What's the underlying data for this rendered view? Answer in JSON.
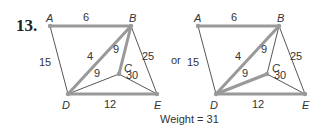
{
  "problem_number": "13.",
  "connector": "or",
  "weight_text": "Weight = 31",
  "colors": {
    "thin_edge": "#444444",
    "thick_edge": "#999999",
    "node": "#999999",
    "text": "#333333"
  },
  "graphs": [
    {
      "id": "left",
      "nodes": {
        "A": {
          "x": 50,
          "y": 26
        },
        "B": {
          "x": 131,
          "y": 26
        },
        "C": {
          "x": 119,
          "y": 74
        },
        "D": {
          "x": 68,
          "y": 94
        },
        "E": {
          "x": 157,
          "y": 94
        }
      },
      "edges": [
        {
          "from": "A",
          "to": "B",
          "weight": "6",
          "highlighted": true,
          "lx": 86,
          "ly": 21
        },
        {
          "from": "A",
          "to": "D",
          "weight": "15",
          "highlighted": false,
          "lx": 45,
          "ly": 66
        },
        {
          "from": "B",
          "to": "D",
          "weight": "4",
          "highlighted": true,
          "lx": 90,
          "ly": 60
        },
        {
          "from": "B",
          "to": "C",
          "weight": "9",
          "highlighted": true,
          "lx": 116,
          "ly": 53
        },
        {
          "from": "B",
          "to": "E",
          "weight": "25",
          "highlighted": false,
          "lx": 148,
          "ly": 60
        },
        {
          "from": "C",
          "to": "D",
          "weight": "9",
          "highlighted": false,
          "lx": 97,
          "ly": 77
        },
        {
          "from": "C",
          "to": "E",
          "weight": "30",
          "highlighted": false,
          "lx": 132,
          "ly": 79
        },
        {
          "from": "D",
          "to": "E",
          "weight": "12",
          "highlighted": true,
          "lx": 110,
          "ly": 108
        }
      ]
    },
    {
      "id": "right",
      "nodes": {
        "A": {
          "x": 198,
          "y": 26
        },
        "B": {
          "x": 279,
          "y": 26
        },
        "C": {
          "x": 267,
          "y": 74
        },
        "D": {
          "x": 216,
          "y": 94
        },
        "E": {
          "x": 305,
          "y": 94
        }
      },
      "edges": [
        {
          "from": "A",
          "to": "B",
          "weight": "6",
          "highlighted": true,
          "lx": 234,
          "ly": 21
        },
        {
          "from": "A",
          "to": "D",
          "weight": "15",
          "highlighted": false,
          "lx": 193,
          "ly": 66
        },
        {
          "from": "B",
          "to": "D",
          "weight": "4",
          "highlighted": true,
          "lx": 238,
          "ly": 60
        },
        {
          "from": "B",
          "to": "C",
          "weight": "9",
          "highlighted": false,
          "lx": 264,
          "ly": 53
        },
        {
          "from": "B",
          "to": "E",
          "weight": "25",
          "highlighted": false,
          "lx": 296,
          "ly": 60
        },
        {
          "from": "C",
          "to": "D",
          "weight": "9",
          "highlighted": true,
          "lx": 245,
          "ly": 77
        },
        {
          "from": "C",
          "to": "E",
          "weight": "30",
          "highlighted": false,
          "lx": 280,
          "ly": 79
        },
        {
          "from": "D",
          "to": "E",
          "weight": "12",
          "highlighted": true,
          "lx": 258,
          "ly": 108
        }
      ]
    }
  ],
  "node_label_offsets": {
    "A": {
      "dx": -4,
      "dy": -4
    },
    "B": {
      "dx": -2,
      "dy": -4
    },
    "C": {
      "dx": 5,
      "dy": -2
    },
    "D": {
      "dx": -6,
      "dy": 15
    },
    "E": {
      "dx": -3,
      "dy": 15
    }
  }
}
